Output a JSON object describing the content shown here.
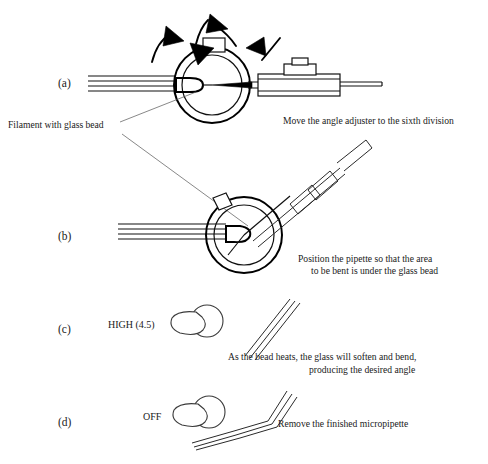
{
  "figure": {
    "background_color": "#ffffff",
    "ink_color": "#111111",
    "width": 488,
    "height": 464
  },
  "panels": [
    {
      "id": "a",
      "label": "(a)",
      "caption": "Move the angle adjuster to the sixth division",
      "caption_lines": [
        "Move the angle adjuster to the sixth division"
      ]
    },
    {
      "id": "b",
      "label": "(b)",
      "caption": "Position the pipette so that the area to be bent is under the glass bead",
      "caption_lines": [
        "Position the pipette so that the area",
        "to be bent is under the glass bead"
      ]
    },
    {
      "id": "c",
      "label": "(c)",
      "caption": "As the bead heats, the glass will soften and bend, producing the desired angle",
      "caption_lines": [
        "As the bead heats, the glass will soften and bend,",
        "producing the desired angle"
      ],
      "dial_setting": "HIGH (4.5)"
    },
    {
      "id": "d",
      "label": "(d)",
      "caption": "Remove the finished micropipette",
      "caption_lines": [
        "Remove the finished micropipette"
      ],
      "dial_setting": "OFF"
    }
  ],
  "annotations": {
    "filament_label": "Filament with glass bead"
  }
}
